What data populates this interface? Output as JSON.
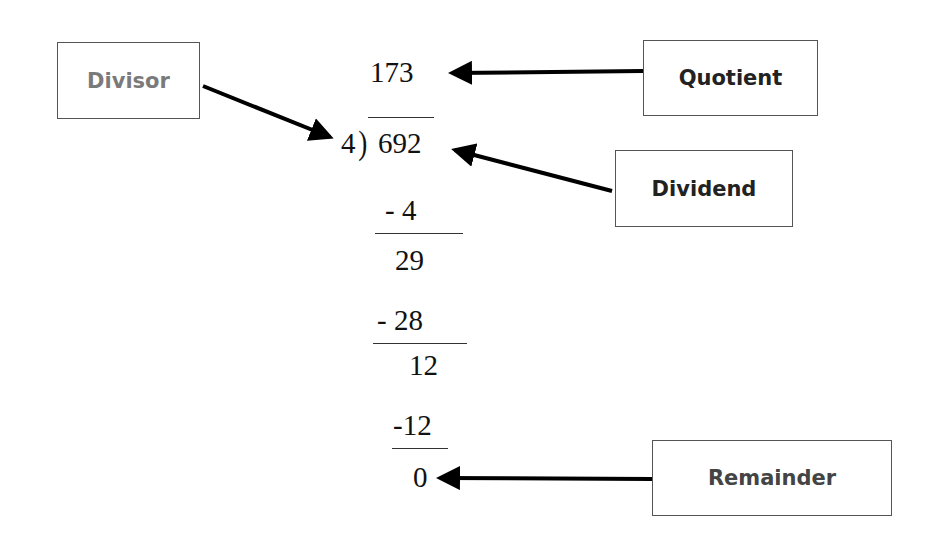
{
  "diagram": {
    "labels": {
      "divisor": "Divisor",
      "quotient": "Quotient",
      "dividend": "Dividend",
      "remainder": "Remainder"
    },
    "division": {
      "quotient": "173",
      "divisor": "4",
      "bracket": ")",
      "dividend": "692",
      "steps": [
        {
          "subtract": "- 4",
          "result": "29"
        },
        {
          "subtract": "- 28",
          "result": "12"
        },
        {
          "subtract": "-12",
          "result": "0"
        }
      ]
    },
    "colors": {
      "divisor_text": "#7a7a7a",
      "label_text": "#222222",
      "remainder_text": "#444444",
      "arrow": "#000000"
    }
  }
}
